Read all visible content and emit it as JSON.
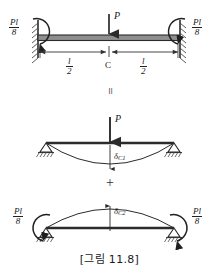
{
  "figure": {
    "caption": "[그림 11.8]",
    "caption_label": "그림",
    "caption_number": "11.8"
  },
  "diagrams": [
    {
      "id": "fixed-fixed-beam",
      "name": "fixed-end beam with central load",
      "support_type": "fixed",
      "load": {
        "symbol": "P",
        "direction": "down",
        "position": "midspan"
      },
      "moments": [
        {
          "side": "left",
          "numerator": "Pl",
          "denominator": "8",
          "sense": "clockwise"
        },
        {
          "side": "right",
          "numerator": "Pl",
          "denominator": "8",
          "sense": "counter-clockwise"
        }
      ],
      "dimensions": [
        {
          "label_num": "l",
          "label_den": "2",
          "side": "left"
        },
        {
          "label_num": "l",
          "label_den": "2",
          "side": "right"
        }
      ],
      "center_point": "C"
    },
    {
      "id": "simply-supported-load",
      "name": "simply supported beam with central load",
      "support_type": "pinned",
      "load": {
        "symbol": "P",
        "direction": "down",
        "position": "midspan"
      },
      "deflection": {
        "symbol": "δ",
        "subscript": "C1",
        "direction": "down"
      }
    },
    {
      "id": "simply-supported-moments",
      "name": "simply supported beam with end moments",
      "support_type": "pinned",
      "moments": [
        {
          "side": "left",
          "numerator": "Pl",
          "denominator": "8",
          "sense": "counter-clockwise"
        },
        {
          "side": "right",
          "numerator": "Pl",
          "denominator": "8",
          "sense": "clockwise"
        }
      ],
      "deflection": {
        "symbol": "δ",
        "subscript": "C2",
        "direction": "up"
      }
    }
  ],
  "operators": {
    "equals": "=",
    "plus": "+"
  },
  "colors": {
    "beam_fill": "#8e8e8e",
    "beam_stroke": "#2b2b2b",
    "line": "#333333",
    "hatch": "#4a4a4a",
    "text": "#1a1a1a"
  }
}
